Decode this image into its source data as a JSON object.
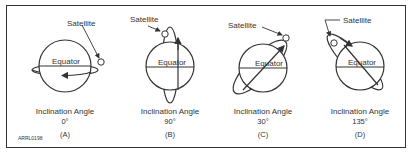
{
  "figure_id": "ARRL0198",
  "panels": [
    {
      "label": "(A)",
      "caption": "Inclination Angle",
      "angle": "0°",
      "satellite": "Satellite",
      "equator": "Equator"
    },
    {
      "label": "(B)",
      "caption": "Inclination Angle",
      "angle": "90°",
      "satellite": "Satellite",
      "equator": "Equator"
    },
    {
      "label": "(C)",
      "caption": "Inclination Angle",
      "angle": "30°",
      "satellite": "Satellite",
      "equator": "Equator"
    },
    {
      "label": "(D)",
      "caption": "Inclination Angle",
      "angle": "135°",
      "satellite": "Satellite",
      "equator": "Equator"
    }
  ]
}
